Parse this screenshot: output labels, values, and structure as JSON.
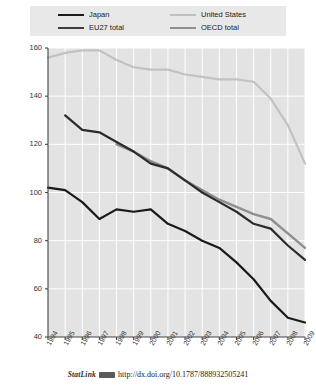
{
  "legend": {
    "entries": [
      {
        "label": "Japan",
        "color": "#1a1a1a",
        "column": "left"
      },
      {
        "label": "EU27 total",
        "color": "#3c3c3c",
        "column": "left"
      },
      {
        "label": "United States",
        "color": "#c0c0c0",
        "column": "right"
      },
      {
        "label": "OECD total",
        "color": "#909090",
        "column": "right"
      }
    ]
  },
  "footer": {
    "statlink_label": "StatLink",
    "glyph": "statlink-barcode-icon",
    "url": "http://dx.doi.org/10.1787/888932505241"
  },
  "chart_data": {
    "type": "line",
    "title": "",
    "subtitle": "",
    "xlabel": "",
    "ylabel": "",
    "x": [
      1994,
      1995,
      1996,
      1997,
      1998,
      1999,
      2000,
      2001,
      2002,
      2003,
      2004,
      2005,
      2006,
      2007,
      2008,
      2009
    ],
    "xtick_labels": [
      "1994",
      "1995",
      "1996",
      "1997",
      "1998",
      "1999",
      "2000",
      "2001",
      "2002",
      "2003",
      "2004",
      "2005",
      "2006",
      "2007",
      "2008",
      "2009"
    ],
    "xlim": [
      1994,
      2009
    ],
    "ylim": [
      40,
      160
    ],
    "yticks": [
      40,
      60,
      80,
      100,
      120,
      140,
      160
    ],
    "ytick_labels": [
      "40",
      "60",
      "80",
      "100",
      "120",
      "140",
      "160"
    ],
    "grid": true,
    "grid_color": "#ffffff",
    "plot_background": "#e3e3e3",
    "legend_position": "top",
    "series": [
      {
        "name": "Japan",
        "color": "#1a1a1a",
        "width": 2.2,
        "x": [
          1994,
          1995,
          1996,
          1997,
          1998,
          1999,
          2000,
          2001,
          2002,
          2003,
          2004,
          2005,
          2006,
          2007,
          2008,
          2009
        ],
        "values": [
          102,
          101,
          96,
          89,
          93,
          92,
          93,
          87,
          84,
          80,
          77,
          71,
          64,
          55,
          48,
          46
        ]
      },
      {
        "name": "EU27 total",
        "color": "#2b2b2b",
        "width": 2.2,
        "x": [
          1995,
          1996,
          1997,
          1998,
          1999,
          2000,
          2001,
          2002,
          2003,
          2004,
          2005,
          2006,
          2007,
          2008,
          2009
        ],
        "values": [
          132,
          126,
          125,
          121,
          117,
          112,
          110,
          105,
          100,
          96,
          92,
          87,
          85,
          78,
          72
        ]
      },
      {
        "name": "United States",
        "color": "#c2c2c2",
        "width": 2.2,
        "x": [
          1994,
          1995,
          1996,
          1997,
          1998,
          1999,
          2000,
          2001,
          2002,
          2003,
          2004,
          2005,
          2006,
          2007,
          2008,
          2009
        ],
        "values": [
          156,
          158,
          159,
          159,
          155,
          152,
          151,
          151,
          149,
          148,
          147,
          147,
          146,
          139,
          128,
          112
        ]
      },
      {
        "name": "OECD total",
        "color": "#8f8f8f",
        "width": 2.4,
        "x": [
          1998,
          1999,
          2000,
          2001,
          2002,
          2003,
          2004,
          2005,
          2006,
          2007,
          2008,
          2009
        ],
        "values": [
          120,
          117,
          113,
          110,
          105,
          101,
          97,
          94,
          91,
          89,
          83,
          77
        ]
      }
    ]
  }
}
